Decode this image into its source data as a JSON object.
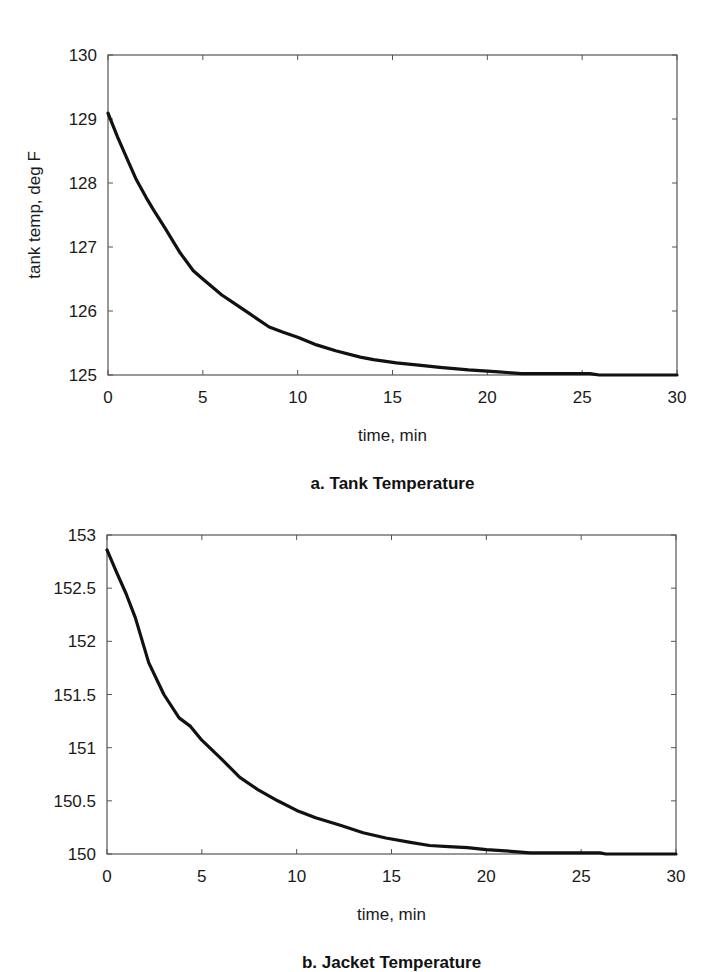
{
  "chart_data": [
    {
      "id": "tank",
      "type": "line",
      "caption": "a. Tank Temperature",
      "xlabel": "time, min",
      "ylabel": "tank temp, deg F",
      "xlim": [
        0,
        30
      ],
      "ylim": [
        125,
        130
      ],
      "xticks": [
        0,
        5,
        10,
        15,
        20,
        25,
        30
      ],
      "xtick_labels": [
        "0",
        "5",
        "10",
        "15",
        "20",
        "25",
        "30"
      ],
      "yticks": [
        125,
        126,
        127,
        128,
        129,
        130
      ],
      "ytick_labels": [
        "125",
        "126",
        "127",
        "128",
        "129",
        "130"
      ],
      "grid": false,
      "legend": null,
      "series": [
        {
          "name": "tank temperature",
          "color": "#111111",
          "x": [
            0,
            0.5,
            1,
            1.5,
            2,
            2.4,
            3,
            3.8,
            4.5,
            5,
            6,
            6.6,
            7.5,
            8.5,
            9.2,
            10,
            11,
            12,
            13.3,
            14,
            15.2,
            16.5,
            17.5,
            19,
            20.6,
            21.8,
            23,
            24,
            25.4,
            25.9,
            27,
            28,
            29,
            30
          ],
          "y": [
            129.09,
            128.72,
            128.38,
            128.05,
            127.78,
            127.58,
            127.3,
            126.91,
            126.63,
            126.5,
            126.25,
            126.13,
            125.95,
            125.75,
            125.67,
            125.59,
            125.47,
            125.38,
            125.28,
            125.24,
            125.19,
            125.15,
            125.12,
            125.08,
            125.05,
            125.02,
            125.02,
            125.02,
            125.02,
            125.0,
            125.0,
            125.0,
            125.0,
            125.0
          ]
        }
      ]
    },
    {
      "id": "jacket",
      "type": "line",
      "caption": "b. Jacket Temperature",
      "xlabel": "time, min",
      "ylabel": "",
      "xlim": [
        0,
        30
      ],
      "ylim": [
        150,
        153
      ],
      "xticks": [
        0,
        5,
        10,
        15,
        20,
        25,
        30
      ],
      "xtick_labels": [
        "0",
        "5",
        "10",
        "15",
        "20",
        "25",
        "30"
      ],
      "yticks": [
        150,
        150.5,
        151,
        151.5,
        152,
        152.5,
        153
      ],
      "ytick_labels": [
        "150",
        "150.5",
        "151",
        "151.5",
        "152",
        "152.5",
        "153"
      ],
      "grid": false,
      "legend": null,
      "series": [
        {
          "name": "jacket temperature",
          "color": "#111111",
          "x": [
            0,
            0.5,
            1,
            1.5,
            2.2,
            3,
            3.8,
            4.4,
            5,
            6,
            7,
            8,
            9,
            10,
            11,
            12.3,
            13.5,
            14.7,
            16,
            17,
            18,
            19,
            20,
            21,
            22.3,
            23,
            24,
            25,
            26,
            26.3,
            27,
            28,
            29,
            30
          ],
          "y": [
            152.86,
            152.65,
            152.45,
            152.22,
            151.8,
            151.5,
            151.28,
            151.2,
            151.07,
            150.9,
            150.72,
            150.6,
            150.5,
            150.41,
            150.34,
            150.27,
            150.2,
            150.15,
            150.11,
            150.08,
            150.07,
            150.06,
            150.04,
            150.03,
            150.01,
            150.01,
            150.01,
            150.01,
            150.01,
            150.0,
            150.0,
            150.0,
            150.0,
            150.0
          ]
        }
      ]
    }
  ],
  "layout": {
    "panels": [
      {
        "left": 108,
        "right": 677,
        "top": 55,
        "bottom": 375,
        "xtick_label_y": 403,
        "xlabel_y": 441,
        "caption_y": 489,
        "ylabel_x": 40
      },
      {
        "left": 107,
        "right": 676,
        "top": 535,
        "bottom": 854,
        "xtick_label_y": 882,
        "xlabel_y": 920,
        "caption_y": 968,
        "ylabel_x": 40
      }
    ]
  }
}
